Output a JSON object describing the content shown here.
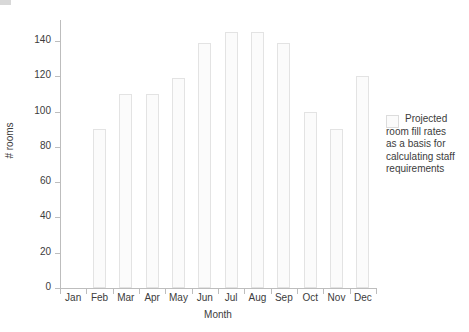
{
  "chart_data": {
    "type": "bar",
    "title": "",
    "subtitle": "",
    "xlabel": "Month",
    "ylabel": "# rooms",
    "categories": [
      "Jan",
      "Feb",
      "Mar",
      "Apr",
      "May",
      "Jun",
      "Jul",
      "Aug",
      "Sep",
      "Oct",
      "Nov",
      "Dec"
    ],
    "values": [
      0,
      90,
      110,
      110,
      119,
      139,
      145,
      145,
      139,
      100,
      90,
      120
    ],
    "series": [
      {
        "name": "Projected room fill rates as a basis for calculating staff requirements",
        "values": [
          0,
          90,
          110,
          110,
          119,
          139,
          145,
          145,
          139,
          100,
          90,
          120
        ]
      }
    ],
    "ylim": [
      0,
      152
    ],
    "yticks": [
      0,
      20,
      40,
      60,
      80,
      100,
      120,
      140
    ],
    "ytick_labels": [
      "0",
      "20",
      "40",
      "60",
      "80",
      "100",
      "120",
      "140"
    ],
    "grid": false,
    "legend_position": "right",
    "legend_entries": [
      {
        "label": "Projected room fill rates as a basis for calculating staff requirements",
        "swatch_color": "#fbfbfb",
        "swatch_border": "#dcdcdc"
      }
    ],
    "bar_fill_color": "#fbfbfb",
    "bar_edge_color": "#e3e3e3",
    "axis_color": "#bdbdbd",
    "text_color": "#3c3c3c",
    "background_color": "#ffffff"
  },
  "legend": {
    "lines": [
      "Projected",
      "room fill rates",
      "as a basis for",
      "calculating staff",
      "requirements"
    ]
  }
}
